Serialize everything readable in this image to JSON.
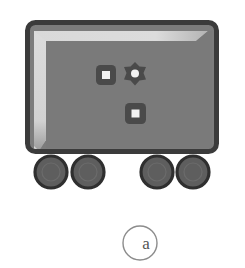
{
  "figure": {
    "name": "vehicle-schematic",
    "caption_label": "a",
    "background_color": "#ffffff"
  },
  "palette": {
    "body_fill": "#7c7c7c",
    "body_border": "#3b3b3b",
    "highlight": "#d9d9d9",
    "inner_shadow": "#6e6e6e",
    "icon_fill": "#4a4a4a",
    "icon_center": "#f2f2f2",
    "wheel_fill": "#5e5e5e",
    "wheel_border": "#343434",
    "caption_stroke": "#8c8c8c",
    "caption_text": "#555555"
  },
  "body": {
    "name": "vehicle-body",
    "x": 25,
    "y": 20,
    "width": 194,
    "height": 134,
    "corner_radius": 9,
    "border_width": 5
  },
  "highlight": {
    "name": "body-highlight",
    "description": "L-shaped light reflection along top and left inner edge, tapering at ends"
  },
  "icons": [
    {
      "name": "rounded-square-icon-left",
      "shape": "rounded-square",
      "cx": 106,
      "cy": 75,
      "size": 20,
      "center_size": 8
    },
    {
      "name": "gear-icon",
      "shape": "gear",
      "cx": 135,
      "cy": 74,
      "size": 22,
      "center_size": 7,
      "teeth": 6
    },
    {
      "name": "rounded-square-icon-lower",
      "shape": "rounded-square",
      "cx": 135,
      "cy": 113,
      "size": 21,
      "center_size": 8
    }
  ],
  "wheels": [
    {
      "name": "wheel-front-left",
      "cx": 51,
      "cy": 172,
      "r": 16
    },
    {
      "name": "wheel-rear-left",
      "cx": 88,
      "cy": 172,
      "r": 16
    },
    {
      "name": "wheel-front-right",
      "cx": 157,
      "cy": 172,
      "r": 16
    },
    {
      "name": "wheel-rear-right",
      "cx": 193,
      "cy": 172,
      "r": 16
    }
  ],
  "caption": {
    "name": "figure-caption",
    "cx": 140,
    "cy": 243,
    "r": 17,
    "label": "a"
  }
}
